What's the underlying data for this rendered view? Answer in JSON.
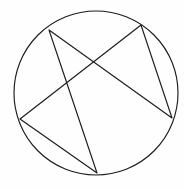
{
  "figure": {
    "background_color": "#fefefe",
    "stroke_color": "#1c1c1c",
    "stroke_width": 1.15,
    "canvas": {
      "width": 184,
      "height": 189
    },
    "circle": {
      "name": "circumscribed-circle",
      "center_x": 96,
      "center_y": 93,
      "radius": 82
    },
    "vertices": [
      {
        "label": "upper-left",
        "x": 49,
        "y": 30
      },
      {
        "label": "upper-right",
        "x": 141,
        "y": 25
      },
      {
        "label": "right",
        "x": 172,
        "y": 118
      },
      {
        "label": "bottom",
        "x": 97,
        "y": 173
      },
      {
        "label": "left",
        "x": 20,
        "y": 119
      }
    ],
    "star_path_order": [
      "upper-left",
      "right",
      "upper-right",
      "left",
      "bottom",
      "upper-left"
    ],
    "star_path_points": "49,30 172,118 141,25 20,119 97,173 49,30",
    "segments": [
      {
        "name": "upper-left-to-right",
        "x1": 49,
        "y1": 30,
        "x2": 172,
        "y2": 118
      },
      {
        "name": "right-to-upper-right",
        "x1": 172,
        "y1": 118,
        "x2": 141,
        "y2": 25
      },
      {
        "name": "upper-right-to-left",
        "x1": 141,
        "y1": 25,
        "x2": 20,
        "y2": 119
      },
      {
        "name": "left-to-bottom",
        "x1": 20,
        "y1": 119,
        "x2": 97,
        "y2": 173
      },
      {
        "name": "bottom-to-upper-left",
        "x1": 97,
        "y1": 173,
        "x2": 49,
        "y2": 30
      }
    ]
  }
}
